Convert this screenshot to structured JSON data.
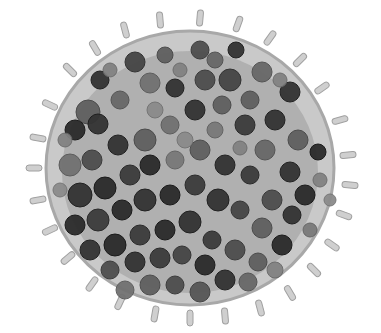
{
  "image": {
    "width": 381,
    "height": 333,
    "background": "#ffffff",
    "subject": "granulated white blood cell (basophil-like) illustration, grayscale"
  },
  "cell": {
    "cx": 190,
    "cy": 168,
    "rx": 150,
    "ry": 143,
    "membrane_fill": "#c9c9c9",
    "membrane_edge": "#a8a8a8",
    "cytoplasm_fill": "#9a9a9a",
    "protrusions": [
      [
        70,
        70,
        -135
      ],
      [
        95,
        48,
        -120
      ],
      [
        125,
        30,
        -105
      ],
      [
        160,
        20,
        -95
      ],
      [
        200,
        18,
        -85
      ],
      [
        238,
        24,
        -70
      ],
      [
        270,
        38,
        -55
      ],
      [
        300,
        60,
        -45
      ],
      [
        322,
        88,
        -35
      ],
      [
        340,
        120,
        -15
      ],
      [
        348,
        155,
        -5
      ],
      [
        350,
        185,
        5
      ],
      [
        344,
        215,
        20
      ],
      [
        332,
        245,
        35
      ],
      [
        314,
        270,
        45
      ],
      [
        290,
        293,
        60
      ],
      [
        260,
        308,
        75
      ],
      [
        225,
        316,
        85
      ],
      [
        190,
        318,
        90
      ],
      [
        155,
        314,
        100
      ],
      [
        120,
        302,
        115
      ],
      [
        92,
        284,
        125
      ],
      [
        68,
        258,
        140
      ],
      [
        50,
        230,
        155
      ],
      [
        38,
        200,
        170
      ],
      [
        34,
        168,
        180
      ],
      [
        38,
        138,
        190
      ],
      [
        50,
        105,
        205
      ]
    ],
    "granules": [
      [
        100,
        80,
        9,
        0.85
      ],
      [
        135,
        62,
        10,
        0.75
      ],
      [
        165,
        55,
        8,
        0.6
      ],
      [
        200,
        50,
        9,
        0.7
      ],
      [
        236,
        50,
        8,
        0.85
      ],
      [
        262,
        72,
        10,
        0.55
      ],
      [
        290,
        92,
        10,
        0.85
      ],
      [
        88,
        112,
        12,
        0.6
      ],
      [
        75,
        130,
        10,
        0.9
      ],
      [
        98,
        124,
        10,
        0.85
      ],
      [
        120,
        100,
        9,
        0.55
      ],
      [
        150,
        83,
        10,
        0.5
      ],
      [
        175,
        88,
        9,
        0.85
      ],
      [
        205,
        80,
        10,
        0.7
      ],
      [
        230,
        80,
        11,
        0.75
      ],
      [
        250,
        100,
        9,
        0.6
      ],
      [
        275,
        120,
        10,
        0.85
      ],
      [
        298,
        140,
        10,
        0.6
      ],
      [
        318,
        152,
        8,
        0.9
      ],
      [
        70,
        165,
        11,
        0.5
      ],
      [
        92,
        160,
        10,
        0.7
      ],
      [
        118,
        145,
        10,
        0.85
      ],
      [
        145,
        140,
        11,
        0.6
      ],
      [
        170,
        125,
        9,
        0.5
      ],
      [
        195,
        110,
        10,
        0.85
      ],
      [
        222,
        105,
        9,
        0.6
      ],
      [
        245,
        125,
        10,
        0.8
      ],
      [
        265,
        150,
        10,
        0.55
      ],
      [
        290,
        172,
        10,
        0.85
      ],
      [
        305,
        195,
        10,
        0.9
      ],
      [
        80,
        195,
        12,
        0.85
      ],
      [
        105,
        188,
        11,
        0.9
      ],
      [
        130,
        175,
        10,
        0.8
      ],
      [
        150,
        165,
        10,
        0.9
      ],
      [
        175,
        160,
        9,
        0.45
      ],
      [
        200,
        150,
        10,
        0.6
      ],
      [
        225,
        165,
        10,
        0.85
      ],
      [
        250,
        175,
        9,
        0.8
      ],
      [
        272,
        200,
        10,
        0.7
      ],
      [
        292,
        215,
        9,
        0.85
      ],
      [
        75,
        225,
        10,
        0.9
      ],
      [
        98,
        220,
        11,
        0.8
      ],
      [
        122,
        210,
        10,
        0.9
      ],
      [
        145,
        200,
        11,
        0.85
      ],
      [
        170,
        195,
        10,
        0.9
      ],
      [
        195,
        185,
        10,
        0.8
      ],
      [
        218,
        200,
        11,
        0.85
      ],
      [
        240,
        210,
        9,
        0.75
      ],
      [
        262,
        228,
        10,
        0.6
      ],
      [
        282,
        245,
        10,
        0.9
      ],
      [
        90,
        250,
        10,
        0.85
      ],
      [
        115,
        245,
        11,
        0.9
      ],
      [
        140,
        235,
        10,
        0.8
      ],
      [
        165,
        230,
        10,
        0.9
      ],
      [
        190,
        222,
        11,
        0.85
      ],
      [
        212,
        240,
        9,
        0.8
      ],
      [
        235,
        250,
        10,
        0.7
      ],
      [
        258,
        262,
        9,
        0.6
      ],
      [
        110,
        270,
        9,
        0.7
      ],
      [
        135,
        262,
        10,
        0.85
      ],
      [
        160,
        258,
        10,
        0.8
      ],
      [
        182,
        255,
        9,
        0.75
      ],
      [
        205,
        265,
        10,
        0.9
      ],
      [
        225,
        280,
        10,
        0.85
      ],
      [
        248,
        282,
        9,
        0.55
      ],
      [
        150,
        285,
        10,
        0.6
      ],
      [
        175,
        285,
        9,
        0.7
      ],
      [
        200,
        292,
        10,
        0.65
      ],
      [
        125,
        290,
        9,
        0.5
      ],
      [
        215,
        60,
        8,
        0.55
      ],
      [
        180,
        70,
        7,
        0.4
      ],
      [
        155,
        110,
        8,
        0.35
      ],
      [
        185,
        140,
        8,
        0.35
      ],
      [
        215,
        130,
        8,
        0.45
      ],
      [
        240,
        148,
        7,
        0.4
      ],
      [
        60,
        190,
        7,
        0.35
      ],
      [
        320,
        180,
        7,
        0.4
      ],
      [
        310,
        230,
        7,
        0.45
      ],
      [
        275,
        270,
        8,
        0.4
      ],
      [
        330,
        200,
        6,
        0.35
      ],
      [
        65,
        140,
        7,
        0.4
      ],
      [
        110,
        70,
        7,
        0.4
      ],
      [
        280,
        80,
        7,
        0.4
      ]
    ]
  }
}
